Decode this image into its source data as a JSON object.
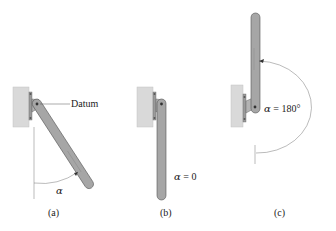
{
  "figure": {
    "panels": [
      {
        "id": "a",
        "caption": "(a)",
        "label": "Datum",
        "angle_symbol": "α",
        "angle_value": "",
        "description": "Rod hanging from pivot, rotated by angle alpha from vertical"
      },
      {
        "id": "b",
        "caption": "(b)",
        "angle_symbol": "α",
        "angle_eq": " = 0",
        "description": "Rod hanging straight down"
      },
      {
        "id": "c",
        "caption": "(c)",
        "angle_symbol": "α",
        "angle_eq": " = 180°",
        "description": "Rod pointing straight up"
      }
    ],
    "colors": {
      "wall": "#d9d9d9",
      "wall_edge": "#bdbdbd",
      "bracket": "#a9a9a9",
      "bracket_dark": "#7d7d7d",
      "rod_fill": "#a6a6a6",
      "rod_edge": "#555555",
      "line": "#444444"
    }
  }
}
